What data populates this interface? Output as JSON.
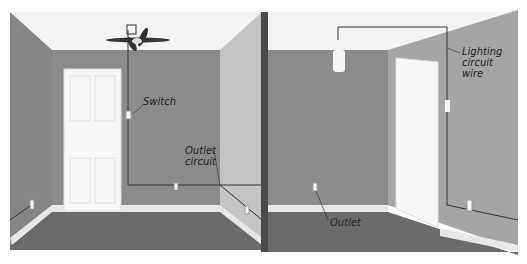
{
  "labels": {
    "switch": "Switch",
    "outlet_circuit": [
      "Outlet",
      "circuit"
    ],
    "outlet": "Outlet",
    "lighting_circuit_wire": [
      "Lighting",
      "circuit",
      "wire"
    ]
  },
  "colors": {
    "wall_back": "#8a8a8a",
    "wall_side_left": "#7f7f7f",
    "wall_side_right_light": "#c8c8c8",
    "floor": "#6a6a6a",
    "ceiling": "#f4f4f4",
    "door": "#f7f7f7",
    "divider": "#4a4a4a",
    "wire": "#333333"
  }
}
